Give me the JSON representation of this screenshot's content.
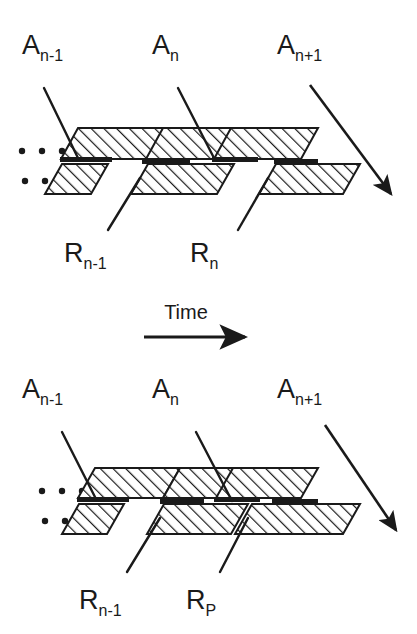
{
  "figure": {
    "title": "",
    "type": "schematic-diagram",
    "background_color": "#ffffff",
    "ink_color": "#1a1a1a"
  },
  "time_axis": {
    "label": "Time",
    "direction": "left-to-right",
    "arrow_icon": "arrow-right-icon"
  },
  "panels": [
    {
      "id": "panel-top",
      "name": "before",
      "top_labels": [
        {
          "base": "A",
          "sub": "n-1"
        },
        {
          "base": "A",
          "sub": "n"
        },
        {
          "base": "A",
          "sub": "n+1"
        }
      ],
      "bottom_labels": [
        {
          "base": "R",
          "sub": "n-1"
        },
        {
          "base": "R",
          "sub": "n"
        }
      ],
      "ellipsis": {
        "upper_dots": 3,
        "lower_dots": 2
      },
      "flow_arrow_icon": "arrow-down-right-icon",
      "upper_segments": 3,
      "lower_segments": 3,
      "lower_band_continuous": false
    },
    {
      "id": "panel-bottom",
      "name": "after",
      "top_labels": [
        {
          "base": "A",
          "sub": "n-1"
        },
        {
          "base": "A",
          "sub": "n"
        },
        {
          "base": "A",
          "sub": "n+1"
        }
      ],
      "bottom_labels": [
        {
          "base": "R",
          "sub": "n-1"
        },
        {
          "base": "R",
          "sub": "P"
        }
      ],
      "ellipsis": {
        "upper_dots": 3,
        "lower_dots": 2
      },
      "flow_arrow_icon": "arrow-down-right-icon",
      "upper_segments": 3,
      "lower_segments": 3,
      "lower_band_continuous": true
    }
  ]
}
